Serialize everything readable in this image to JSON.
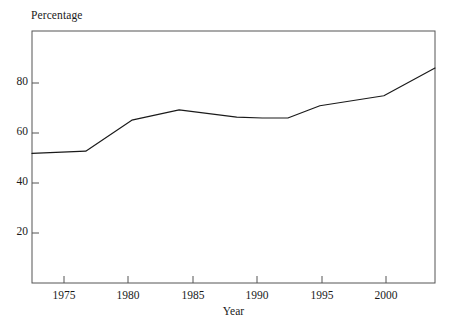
{
  "chart_data": {
    "type": "line",
    "title": "",
    "subtitle": "",
    "xlabel": "Year",
    "ylabel": "Percentage",
    "xlim": [
      1972.5,
      2004
    ],
    "ylim": [
      0,
      91
    ],
    "grid": false,
    "legend": null,
    "xticks": [
      1975,
      1980,
      1985,
      1990,
      1995,
      2000
    ],
    "xtick_labels": [
      "1975",
      "1980",
      "1985",
      "1990",
      "1995",
      "2000"
    ],
    "yticks": [
      20,
      40,
      60,
      80
    ],
    "ytick_labels": [
      "20",
      "40",
      "60",
      "80"
    ],
    "series": [
      {
        "name": "Percentage",
        "color": "#1a1a1a",
        "x": [
          1972.5,
          1976.7,
          1980.3,
          1984.0,
          1988.5,
          1990.5,
          1992.5,
          1995.0,
          2000.0,
          2004.0
        ],
        "values": [
          46.8,
          47.6,
          58.8,
          62.5,
          59.9,
          59.6,
          59.6,
          64.0,
          67.6,
          77.6
        ]
      }
    ],
    "annotations": [],
    "axis_color": "#555555",
    "line_color": "#1a1a1a",
    "background": "#ffffff"
  }
}
